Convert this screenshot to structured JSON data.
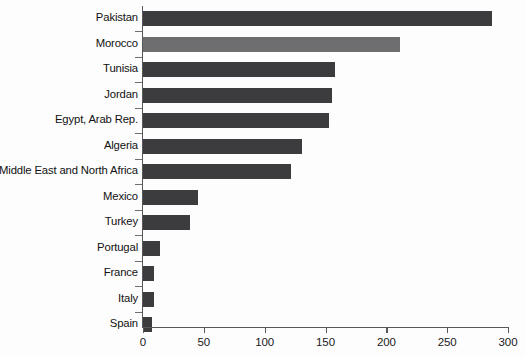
{
  "chart_data": {
    "type": "bar",
    "orientation": "horizontal",
    "title": "",
    "subtitle": "",
    "xlabel": "",
    "ylabel": "",
    "xlim": [
      0,
      300
    ],
    "ylim": null,
    "grid": false,
    "legend": null,
    "xticks": [
      0,
      50,
      100,
      150,
      200,
      250,
      300
    ],
    "xtick_labels": [
      "0",
      "50",
      "100",
      "150",
      "200",
      "250",
      "300"
    ],
    "categories": [
      "Pakistan",
      "Morocco",
      "Tunisia",
      "Jordan",
      "Egypt, Arab Rep.",
      "Algeria",
      "Middle East and North Africa",
      "Mexico",
      "Turkey",
      "Portugal",
      "France",
      "Italy",
      "Spain"
    ],
    "values": [
      287,
      211,
      158,
      155,
      153,
      131,
      122,
      45,
      39,
      14,
      9,
      9,
      7
    ],
    "bar_colors": [
      "#3c3c3e",
      "#6e6e70",
      "#3c3c3e",
      "#3c3c3e",
      "#3c3c3e",
      "#3c3c3e",
      "#3c3c3e",
      "#3c3c3e",
      "#3c3c3e",
      "#3c3c3e",
      "#3c3c3e",
      "#3c3c3e",
      "#3c3c3e"
    ],
    "highlight_category": "Morocco",
    "colors": {
      "bar_default": "#3c3c3e",
      "bar_highlight": "#6e6e70",
      "axis": "#58585a",
      "text": "#111111",
      "background": "#fdfdfd"
    }
  }
}
